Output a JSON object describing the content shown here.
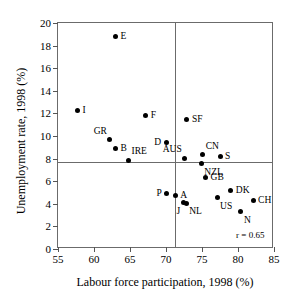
{
  "chart_data": {
    "type": "scatter",
    "title": "",
    "xlabel": "Labour force participation, 1998 (%)",
    "ylabel": "Unemployment rate, 1998 (%)",
    "xlim": [
      55,
      85
    ],
    "ylim": [
      0,
      20
    ],
    "xticks": [
      55,
      60,
      65,
      70,
      75,
      80,
      85
    ],
    "yticks": [
      0,
      2,
      4,
      6,
      8,
      10,
      12,
      14,
      16,
      18,
      20
    ],
    "grid": false,
    "legend": null,
    "annotations": [
      {
        "text": "r = 0.65",
        "x": 81.7,
        "y": 1.25
      }
    ],
    "reference_lines": [
      {
        "orientation": "vertical",
        "value": 71.3
      },
      {
        "orientation": "horizontal",
        "value": 7.7
      }
    ],
    "points": [
      {
        "label": "I",
        "x": 57.7,
        "y": 12.25,
        "label_pos": "right"
      },
      {
        "label": "GR",
        "x": 62.2,
        "y": 9.65,
        "label_pos": "upper-left"
      },
      {
        "label": "B",
        "x": 63.0,
        "y": 8.85,
        "label_pos": "right"
      },
      {
        "label": "E",
        "x": 63.0,
        "y": 18.8,
        "label_pos": "right"
      },
      {
        "label": "IRE",
        "x": 64.8,
        "y": 7.85,
        "label_pos": "upper-right"
      },
      {
        "label": "F",
        "x": 67.2,
        "y": 11.8,
        "label_pos": "right"
      },
      {
        "label": "D",
        "x": 70.0,
        "y": 9.45,
        "label_pos": "left"
      },
      {
        "label": "P",
        "x": 70.1,
        "y": 4.95,
        "label_pos": "left"
      },
      {
        "label": "A",
        "x": 71.3,
        "y": 4.7,
        "label_pos": "right"
      },
      {
        "label": "J",
        "x": 72.4,
        "y": 4.1,
        "label_pos": "lower-left"
      },
      {
        "label": "NL",
        "x": 72.8,
        "y": 4.05,
        "label_pos": "lower-right"
      },
      {
        "label": "AUS",
        "x": 72.6,
        "y": 8.05,
        "label_pos": "upper-left"
      },
      {
        "label": "SF",
        "x": 72.9,
        "y": 11.5,
        "label_pos": "right"
      },
      {
        "label": "NZL",
        "x": 74.9,
        "y": 7.55,
        "label_pos": "lower-right"
      },
      {
        "label": "CN",
        "x": 75.1,
        "y": 8.35,
        "label_pos": "upper-right"
      },
      {
        "label": "GB",
        "x": 75.5,
        "y": 6.35,
        "label_pos": "right"
      },
      {
        "label": "S",
        "x": 77.5,
        "y": 8.2,
        "label_pos": "right"
      },
      {
        "label": "US",
        "x": 77.1,
        "y": 4.55,
        "label_pos": "lower-right"
      },
      {
        "label": "DK",
        "x": 79.0,
        "y": 5.2,
        "label_pos": "right"
      },
      {
        "label": "N",
        "x": 80.4,
        "y": 3.3,
        "label_pos": "lower-right"
      },
      {
        "label": "CH",
        "x": 82.1,
        "y": 4.25,
        "label_pos": "right"
      }
    ]
  }
}
